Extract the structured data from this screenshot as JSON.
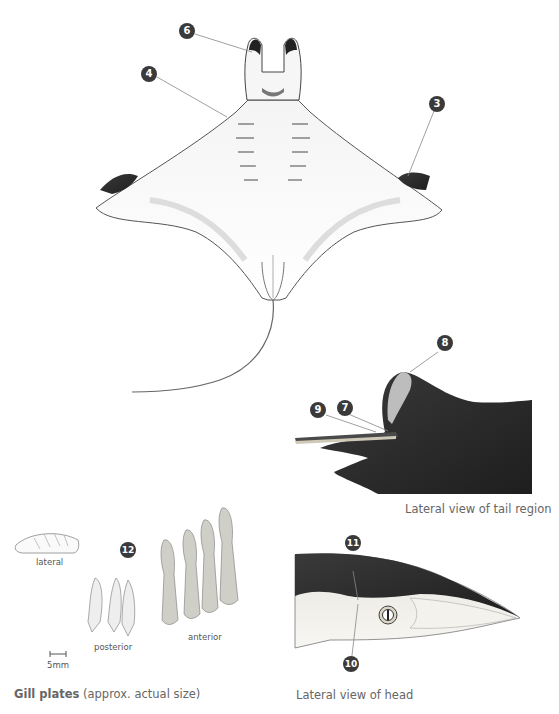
{
  "figure": {
    "main_view": {
      "callouts": [
        {
          "id": "6",
          "label": "6"
        },
        {
          "id": "4",
          "label": "4"
        },
        {
          "id": "3",
          "label": "3"
        }
      ]
    },
    "tail_view": {
      "caption": "Lateral view of tail region",
      "callouts": [
        {
          "id": "8",
          "label": "8"
        },
        {
          "id": "9",
          "label": "9"
        },
        {
          "id": "7",
          "label": "7"
        }
      ]
    },
    "head_view": {
      "caption": "Lateral view of head",
      "callouts": [
        {
          "id": "11",
          "label": "11"
        },
        {
          "id": "10",
          "label": "10"
        }
      ]
    },
    "gill_plates": {
      "caption_bold": "Gill plates",
      "caption_rest": " (approx. actual size)",
      "callout": "12",
      "labels": {
        "lateral": "lateral",
        "posterior": "posterior",
        "anterior": "anterior",
        "scale": "5mm"
      }
    },
    "colors": {
      "callout_fill": "#3a3a3a",
      "dark_skin": "#2a2a2a",
      "leader_line": "#888888",
      "caption_text": "#666666"
    }
  }
}
